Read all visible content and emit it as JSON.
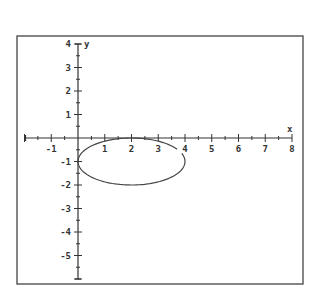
{
  "chart_data": {
    "type": "line",
    "title": "",
    "xlabel": "x",
    "ylabel": "y",
    "xlim": [
      -2,
      8
    ],
    "ylim": [
      -6,
      4
    ],
    "grid": false,
    "legend": null,
    "x_ticks": [
      -1,
      1,
      2,
      3,
      4,
      5,
      6,
      7,
      8
    ],
    "x_tick_labels": [
      "-1",
      "1",
      "2",
      "3",
      "4",
      "5",
      "6",
      "7",
      "8"
    ],
    "y_ticks": [
      4,
      3,
      2,
      1,
      -1,
      -2,
      -3,
      -4,
      -5
    ],
    "y_tick_labels": [
      "4",
      "3",
      "2",
      "1",
      "-1",
      "-2",
      "-3",
      "-4",
      "-5"
    ],
    "minor_ticks_per_unit": 2,
    "series": [
      {
        "name": "ellipse",
        "shape": "ellipse",
        "center": [
          2,
          -1
        ],
        "rx": 2,
        "ry": 1,
        "equation": "(x-2)^2/4 + (y+1)^2 = 1",
        "color": "#444444"
      }
    ]
  },
  "axes": {
    "x_label": "x",
    "y_label": "y"
  },
  "colors": {
    "axis": "#333333",
    "frame": "#444444",
    "curve": "#555555",
    "background": "#ffffff"
  }
}
